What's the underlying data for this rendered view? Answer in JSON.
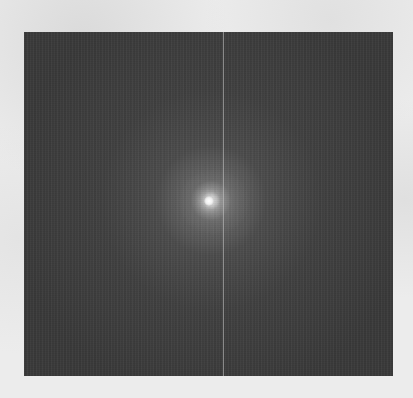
{
  "image": {
    "description": "Scanned grayscale figure: dark noisy square field with a small bright point source at center and a faint vertical streak line",
    "background_color": "#ececec",
    "field": {
      "color": "#3a3a3a",
      "x": 24,
      "y": 32,
      "width": 369,
      "height": 344
    },
    "point_source": {
      "x": 209,
      "y": 201,
      "color": "#f4f4f4"
    },
    "vertical_line": {
      "x": 223,
      "color": "#c8c8c8"
    }
  },
  "bleed_through_text": ""
}
